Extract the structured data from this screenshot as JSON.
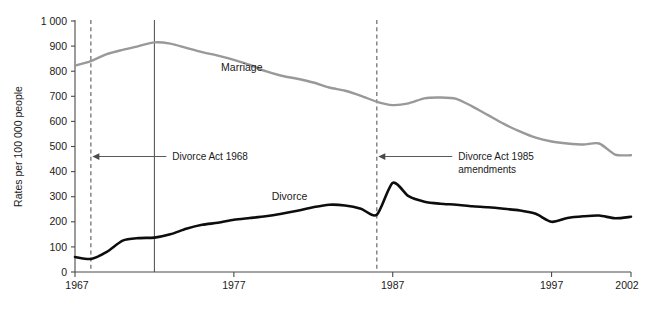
{
  "chart_data": {
    "type": "line",
    "title": "",
    "xlabel": "",
    "ylabel": "Rates per 100 000 people",
    "xlim": [
      1967,
      2002
    ],
    "ylim": [
      0,
      1000
    ],
    "grid": false,
    "legend_position": "inline-labels",
    "x_ticks": [
      "1967",
      "1977",
      "1987",
      "1997",
      "2002"
    ],
    "x_tick_values": [
      1967,
      1977,
      1987,
      1997,
      2002
    ],
    "y_ticks": [
      "0",
      "100",
      "200",
      "300",
      "400",
      "500",
      "600",
      "700",
      "800",
      "900",
      "1 000"
    ],
    "y_tick_values": [
      0,
      100,
      200,
      300,
      400,
      500,
      600,
      700,
      800,
      900,
      1000
    ],
    "x": [
      1967,
      1968,
      1969,
      1970,
      1971,
      1972,
      1973,
      1974,
      1975,
      1976,
      1977,
      1978,
      1979,
      1980,
      1981,
      1982,
      1983,
      1984,
      1985,
      1986,
      1987,
      1988,
      1989,
      1990,
      1991,
      1992,
      1993,
      1994,
      1995,
      1996,
      1997,
      1998,
      1999,
      2000,
      2001,
      2002
    ],
    "series": [
      {
        "name": "Marriage",
        "color": "#999999",
        "label_x": 1977.5,
        "label_y": 800,
        "values": [
          822,
          840,
          868,
          885,
          900,
          915,
          910,
          893,
          876,
          862,
          845,
          825,
          800,
          782,
          770,
          755,
          735,
          722,
          702,
          678,
          665,
          672,
          692,
          695,
          690,
          660,
          625,
          590,
          560,
          535,
          520,
          512,
          508,
          512,
          468,
          465
        ]
      },
      {
        "name": "Divorce",
        "color": "#0d0d0d",
        "label_x": 1980.5,
        "label_y": 285,
        "values": [
          60,
          52,
          80,
          125,
          135,
          137,
          150,
          172,
          188,
          196,
          208,
          215,
          222,
          232,
          244,
          258,
          268,
          265,
          252,
          228,
          355,
          302,
          280,
          272,
          268,
          262,
          258,
          252,
          245,
          232,
          200,
          215,
          222,
          225,
          214,
          220
        ]
      }
    ],
    "annotations": [
      {
        "text_line1": "Divorce Act 1968",
        "text_line2": "",
        "event_year": 1968,
        "line_style": "dashed",
        "label_x": 1973,
        "label_y": 460
      },
      {
        "text_line1": "Divorce Act 1985",
        "text_line2": "amendments",
        "event_year": 1986,
        "line_style": "dashed",
        "label_x": 1991,
        "label_y": 460
      },
      {
        "text_line1": "",
        "text_line2": "",
        "event_year": 1972,
        "line_style": "solid",
        "label_x": 0,
        "label_y": 0
      }
    ]
  }
}
